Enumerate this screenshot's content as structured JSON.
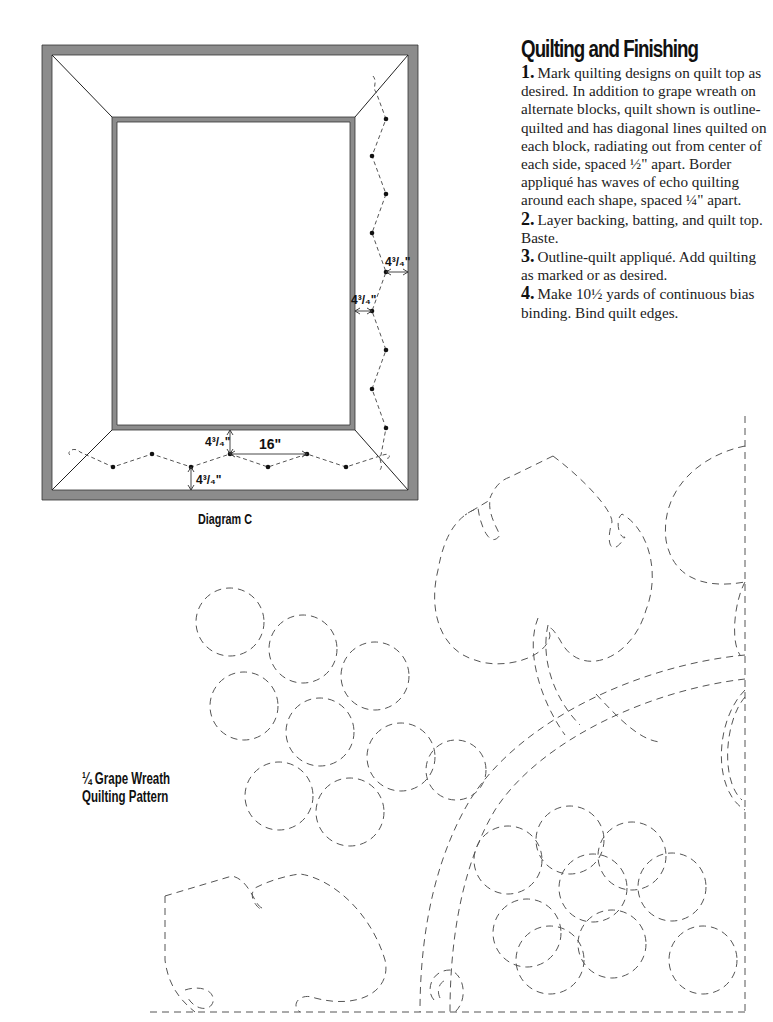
{
  "section": {
    "title": "Quilting and Finishing",
    "steps": [
      {
        "num": "1.",
        "text": "Mark quilting designs on quilt top as desired. In addition to grape wreath on alternate blocks, quilt shown is outline-quilted and has diagonal lines quilted on each block, radiating out from center of each side, spaced ½\" apart. Border appliqué has waves of echo quilting around each shape, spaced ¼\" apart."
      },
      {
        "num": "2.",
        "text": "Layer backing, batting, and quilt top. Baste."
      },
      {
        "num": "3.",
        "text": "Outline-quilt appliqué. Add quilting as marked or as desired."
      },
      {
        "num": "4.",
        "text": "Make 10½ yards of continuous bias binding. Bind quilt edges."
      }
    ]
  },
  "diagram": {
    "caption": "Diagram C",
    "colors": {
      "border": "#8c8c8c",
      "line": "#222222",
      "dash": "#555555"
    },
    "measurements": {
      "right_outer": "4³/₄\"",
      "right_inner": "4³/₄\"",
      "bottom_inner": "4³/₄\"",
      "bottom_outer": "4³/₄\"",
      "repeat": "16\""
    }
  },
  "pattern": {
    "label_line1": "¼ Grape Wreath",
    "label_line2": "Quilting Pattern"
  }
}
